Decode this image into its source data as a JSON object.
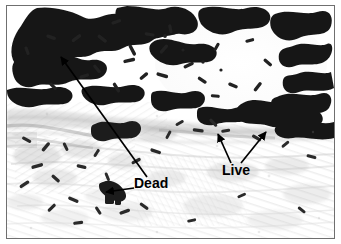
{
  "figure": {
    "kind": "microscopy-micrograph",
    "modality": "brightfield light micrograph, grayscale",
    "border_color": "#6f6f6f",
    "background_color": "#ffffff",
    "width": 341,
    "height": 244
  },
  "annotations": {
    "labels": [
      {
        "id": "dead",
        "text": "Dead",
        "x": 134,
        "y": 176,
        "color": "#000000",
        "points_to": "dense dark bacterial aggregate upper-left and small dark cluster lower-left"
      },
      {
        "id": "live",
        "text": "Live",
        "x": 222,
        "y": 163,
        "color": "#000000",
        "points_to": "two sparse bacteria sites along the tissue band"
      }
    ],
    "arrows": [
      {
        "id": "dead-arrow-long",
        "label": "Dead",
        "from_x": 146,
        "from_y": 175,
        "to_x": 59,
        "to_y": 55,
        "color": "#000000"
      },
      {
        "id": "dead-arrow-short",
        "label": "Dead",
        "from_x": 132,
        "from_y": 186,
        "to_x": 104,
        "to_y": 190,
        "color": "#000000"
      },
      {
        "id": "live-arrow-left",
        "label": "Live",
        "from_x": 230,
        "from_y": 160,
        "to_x": 217,
        "to_y": 132,
        "color": "#000000"
      },
      {
        "id": "live-arrow-right",
        "label": "Live",
        "from_x": 240,
        "from_y": 160,
        "to_x": 265,
        "to_y": 130,
        "color": "#000000"
      }
    ]
  },
  "regions": {
    "upper_field": "dense dark clumps of bacilli across the top half",
    "upper_right_void": "large pale clear zone in the upper right framed by bacteria",
    "mid_band": "grey fibrous tissue band running diagonally across the middle",
    "lower_field": "pale striated tissue with scattered individual dark rods"
  }
}
